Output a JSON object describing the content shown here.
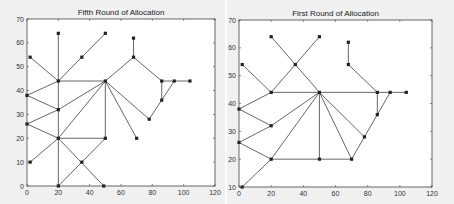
{
  "chart_data": [
    {
      "type": "scatter",
      "subtype": "network-graph",
      "title": "Fifth Round of Allocation",
      "xlabel": "",
      "ylabel": "",
      "xlim": [
        0,
        120
      ],
      "ylim": [
        0,
        70
      ],
      "xticks": [
        0,
        20,
        40,
        60,
        80,
        100,
        120
      ],
      "yticks": [
        0,
        10,
        20,
        30,
        40,
        50,
        60,
        70
      ],
      "grid": false,
      "nodes": [
        [
          20,
          64
        ],
        [
          50,
          64
        ],
        [
          2,
          54
        ],
        [
          35,
          54
        ],
        [
          68,
          62
        ],
        [
          68,
          54
        ],
        [
          20,
          44
        ],
        [
          50,
          44
        ],
        [
          86,
          44
        ],
        [
          94,
          44
        ],
        [
          104,
          44
        ],
        [
          0,
          38
        ],
        [
          20,
          32
        ],
        [
          86,
          36
        ],
        [
          78,
          28
        ],
        [
          0,
          26
        ],
        [
          20,
          20
        ],
        [
          50,
          20
        ],
        [
          70,
          20
        ],
        [
          2,
          10
        ],
        [
          35,
          10
        ],
        [
          20,
          0
        ],
        [
          49,
          0
        ]
      ],
      "edges": [
        [
          [
            20,
            64
          ],
          [
            20,
            0
          ]
        ],
        [
          [
            2,
            54
          ],
          [
            20,
            44
          ]
        ],
        [
          [
            35,
            54
          ],
          [
            50,
            64
          ]
        ],
        [
          [
            20,
            44
          ],
          [
            35,
            54
          ]
        ],
        [
          [
            20,
            44
          ],
          [
            50,
            44
          ]
        ],
        [
          [
            0,
            38
          ],
          [
            20,
            44
          ]
        ],
        [
          [
            0,
            38
          ],
          [
            20,
            32
          ]
        ],
        [
          [
            20,
            32
          ],
          [
            50,
            44
          ]
        ],
        [
          [
            0,
            26
          ],
          [
            20,
            32
          ]
        ],
        [
          [
            0,
            26
          ],
          [
            20,
            20
          ]
        ],
        [
          [
            20,
            20
          ],
          [
            50,
            44
          ]
        ],
        [
          [
            20,
            20
          ],
          [
            50,
            20
          ]
        ],
        [
          [
            50,
            20
          ],
          [
            50,
            44
          ]
        ],
        [
          [
            2,
            10
          ],
          [
            20,
            20
          ]
        ],
        [
          [
            20,
            20
          ],
          [
            49,
            0
          ]
        ],
        [
          [
            20,
            0
          ],
          [
            35,
            10
          ]
        ],
        [
          [
            35,
            10
          ],
          [
            50,
            20
          ]
        ],
        [
          [
            50,
            44
          ],
          [
            68,
            54
          ]
        ],
        [
          [
            68,
            54
          ],
          [
            68,
            62
          ]
        ],
        [
          [
            68,
            54
          ],
          [
            86,
            44
          ]
        ],
        [
          [
            86,
            44
          ],
          [
            104,
            44
          ]
        ],
        [
          [
            86,
            44
          ],
          [
            86,
            36
          ]
        ],
        [
          [
            86,
            36
          ],
          [
            94,
            44
          ]
        ],
        [
          [
            86,
            36
          ],
          [
            78,
            28
          ]
        ],
        [
          [
            78,
            28
          ],
          [
            50,
            44
          ]
        ],
        [
          [
            50,
            44
          ],
          [
            70,
            20
          ]
        ]
      ]
    },
    {
      "type": "scatter",
      "subtype": "network-graph",
      "title": "First Round of Allocation",
      "xlabel": "",
      "ylabel": "",
      "xlim": [
        0,
        120
      ],
      "ylim": [
        10,
        70
      ],
      "xticks": [
        0,
        20,
        40,
        60,
        80,
        100,
        120
      ],
      "yticks": [
        10,
        20,
        30,
        40,
        50,
        60,
        70
      ],
      "grid": false,
      "nodes": [
        [
          20,
          64
        ],
        [
          50,
          64
        ],
        [
          2,
          54
        ],
        [
          35,
          54
        ],
        [
          68,
          62
        ],
        [
          68,
          54
        ],
        [
          20,
          44
        ],
        [
          50,
          44
        ],
        [
          86,
          44
        ],
        [
          94,
          44
        ],
        [
          104,
          44
        ],
        [
          0,
          38
        ],
        [
          20,
          32
        ],
        [
          86,
          36
        ],
        [
          78,
          28
        ],
        [
          0,
          26
        ],
        [
          20,
          20
        ],
        [
          50,
          20
        ],
        [
          70,
          20
        ],
        [
          2,
          10
        ]
      ],
      "edges": [
        [
          [
            20,
            64
          ],
          [
            35,
            54
          ]
        ],
        [
          [
            35,
            54
          ],
          [
            50,
            64
          ]
        ],
        [
          [
            35,
            54
          ],
          [
            20,
            44
          ]
        ],
        [
          [
            35,
            54
          ],
          [
            50,
            44
          ]
        ],
        [
          [
            2,
            54
          ],
          [
            20,
            44
          ]
        ],
        [
          [
            20,
            44
          ],
          [
            104,
            44
          ]
        ],
        [
          [
            0,
            38
          ],
          [
            20,
            44
          ]
        ],
        [
          [
            0,
            38
          ],
          [
            20,
            32
          ]
        ],
        [
          [
            20,
            32
          ],
          [
            50,
            44
          ]
        ],
        [
          [
            0,
            26
          ],
          [
            20,
            32
          ]
        ],
        [
          [
            0,
            26
          ],
          [
            20,
            20
          ]
        ],
        [
          [
            20,
            20
          ],
          [
            50,
            44
          ]
        ],
        [
          [
            20,
            20
          ],
          [
            70,
            20
          ]
        ],
        [
          [
            50,
            20
          ],
          [
            50,
            44
          ]
        ],
        [
          [
            2,
            10
          ],
          [
            20,
            20
          ]
        ],
        [
          [
            50,
            44
          ],
          [
            78,
            28
          ]
        ],
        [
          [
            50,
            44
          ],
          [
            70,
            20
          ]
        ],
        [
          [
            70,
            20
          ],
          [
            78,
            28
          ]
        ],
        [
          [
            78,
            28
          ],
          [
            86,
            36
          ]
        ],
        [
          [
            86,
            36
          ],
          [
            94,
            44
          ]
        ],
        [
          [
            86,
            44
          ],
          [
            86,
            36
          ]
        ],
        [
          [
            68,
            54
          ],
          [
            68,
            62
          ]
        ],
        [
          [
            68,
            54
          ],
          [
            86,
            44
          ]
        ]
      ]
    }
  ],
  "colors": {
    "line": "#555555",
    "node": "#222222",
    "axes": "#444444",
    "panel_bg": "#f0f0f0",
    "plot_bg": "#ffffff"
  }
}
